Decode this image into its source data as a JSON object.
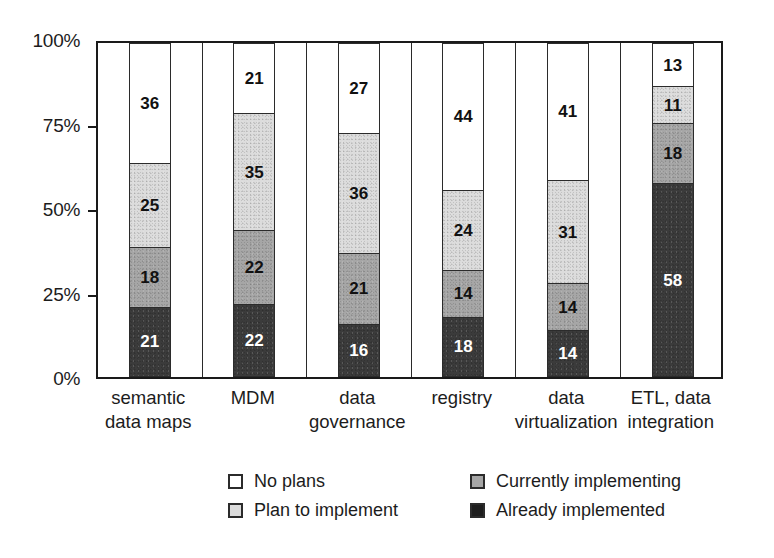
{
  "chart_data": {
    "type": "bar",
    "subtype": "stacked-100-percent-column",
    "title": "",
    "subtitle": "",
    "xlabel": "",
    "ylabel": "",
    "ylim": [
      0,
      100
    ],
    "ytick_labels": [
      "0%",
      "25%",
      "50%",
      "75%",
      "100%"
    ],
    "ytick_values": [
      0,
      25,
      50,
      75,
      100
    ],
    "grid": false,
    "legend_position": "bottom",
    "categories": [
      "semantic\ndata maps",
      "MDM",
      "data\ngovernance",
      "registry",
      "data\nvirtualization",
      "ETL, data\nintegration"
    ],
    "series": [
      {
        "name": "Already implemented",
        "color": "#3b3b3b",
        "values": [
          21,
          22,
          16,
          18,
          14,
          58
        ]
      },
      {
        "name": "Currently implementing",
        "color": "#a6a6a6",
        "values": [
          18,
          22,
          21,
          14,
          14,
          18
        ]
      },
      {
        "name": "Plan to implement",
        "color": "#dcdcdc",
        "values": [
          25,
          35,
          36,
          24,
          31,
          11
        ]
      },
      {
        "name": "No plans",
        "color": "#ffffff",
        "values": [
          36,
          21,
          27,
          44,
          41,
          13
        ]
      }
    ],
    "stack_order_bottom_to_top": [
      "Already implemented",
      "Currently implementing",
      "Plan to implement",
      "No plans"
    ]
  },
  "legend": {
    "items": [
      {
        "label": "No plans",
        "swatch": "no-plans",
        "color": "#ffffff"
      },
      {
        "label": "Plan to implement",
        "swatch": "plan",
        "color": "#dcdcdc"
      },
      {
        "label": "Currently implementing",
        "swatch": "current",
        "color": "#a6a6a6"
      },
      {
        "label": "Already implemented",
        "swatch": "already",
        "color": "#1e1e1e"
      }
    ]
  }
}
